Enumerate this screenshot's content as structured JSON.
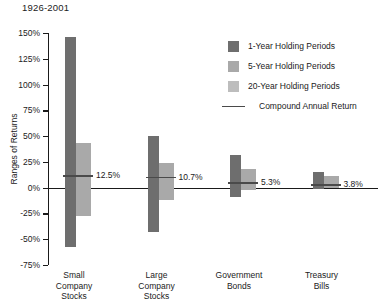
{
  "chart_data": {
    "type": "bar",
    "title": "1926-2001",
    "xlabel": "",
    "ylabel": "Ranges of Returns",
    "ylim": [
      -75,
      150
    ],
    "ytick_labels": [
      "150%",
      "125%",
      "100%",
      "75%",
      "50%",
      "25%",
      "0%",
      "-25%",
      "-50%",
      "-75%"
    ],
    "yticks": [
      150,
      125,
      100,
      75,
      50,
      25,
      0,
      -25,
      -50,
      -75
    ],
    "grid": false,
    "legend_position": "upper right",
    "categories": [
      "Small Company Stocks",
      "Large Company Stocks",
      "Government Bonds",
      "Treasury Bills"
    ],
    "series": [
      {
        "name": "1-Year Holding Periods",
        "color": "#6e6e6e",
        "ranges": [
          {
            "high": 146,
            "low": -58
          },
          {
            "high": 50,
            "low": -43
          },
          {
            "high": 32,
            "low": -9
          },
          {
            "high": 15,
            "low": -1
          }
        ]
      },
      {
        "name": "5-Year Holding Periods",
        "color": "#a9a9a9",
        "ranges": [
          {
            "high": 43,
            "low": -27
          },
          {
            "high": 24,
            "low": -12
          },
          {
            "high": 18,
            "low": -2
          },
          {
            "high": 11,
            "low": 0
          }
        ]
      },
      {
        "name": "20-Year Holding Periods",
        "color": "#bdbdbd",
        "ranges": [
          {
            "high": 21,
            "low": 6
          },
          {
            "high": 17,
            "low": 3
          },
          {
            "high": 12,
            "low": 1
          },
          {
            "high": 7,
            "low": 0
          }
        ]
      }
    ],
    "compound_annual_return": {
      "name": "Compound Annual Return",
      "color": "#4a4a4a",
      "values": [
        12.5,
        10.7,
        5.3,
        3.8
      ],
      "labels": [
        "12.5%",
        "10.7%",
        "5.3%",
        "3.8%"
      ]
    }
  },
  "legend": {
    "items": [
      {
        "label": "1-Year Holding Periods",
        "swatch": "s1"
      },
      {
        "label": "5-Year Holding Periods",
        "swatch": "s5"
      },
      {
        "label": "20-Year Holding Periods",
        "swatch": "s20"
      },
      {
        "label": "Compound Annual Return",
        "swatch": "line"
      }
    ]
  },
  "x_labels": [
    "Small\nCompany\nStocks",
    "Large\nCompany\nStocks",
    "Government\nBonds",
    "Treasury\nBills"
  ]
}
